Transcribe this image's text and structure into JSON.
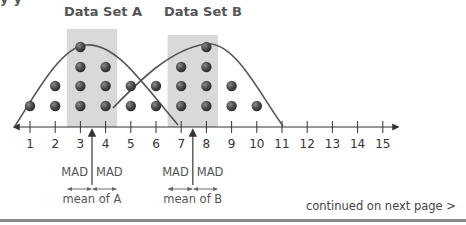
{
  "header": {
    "cut_text": "y                     y                     "
  },
  "titles": {
    "set_a": "Data Set A",
    "set_b": "Data Set B"
  },
  "footer": {
    "continued": "continued on next page >"
  },
  "annotations": {
    "mad": "MAD",
    "mean_a": "mean of A",
    "mean_b": "mean of B"
  },
  "chart_data": {
    "type": "dot plot",
    "title": "",
    "xlabel": "",
    "ylabel": "",
    "x_ticks": [
      1,
      2,
      3,
      4,
      5,
      6,
      7,
      8,
      9,
      10,
      11,
      12,
      13,
      14,
      15
    ],
    "xlim": [
      0.3,
      15.6
    ],
    "series": [
      {
        "name": "Data Set A",
        "counts": {
          "1": 1,
          "2": 2,
          "3": 4,
          "4": 3,
          "5": 2,
          "6": 1
        },
        "mean": 3.5,
        "mad_band": [
          2.5,
          4.5
        ]
      },
      {
        "name": "Data Set B",
        "counts": {
          "6": 1,
          "7": 3,
          "8": 4,
          "9": 2,
          "10": 1
        },
        "mean": 7.5,
        "mad_band": [
          6.5,
          8.5
        ]
      }
    ],
    "curves": [
      "bell-shaped outline over Data Set A",
      "bell-shaped outline over Data Set B"
    ],
    "legend": "none",
    "grid": false,
    "colors": {
      "dot": "#4a4a4a",
      "band": "#d9d9d9",
      "curve": "#555555",
      "axis": "#333333"
    }
  }
}
